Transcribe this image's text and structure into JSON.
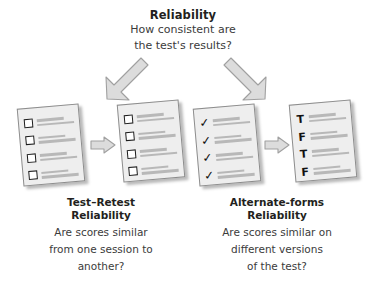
{
  "header": {
    "title": "Reliability",
    "subtitle_line1": "How consistent are",
    "subtitle_line2": "the test's results?"
  },
  "colors": {
    "background": "#ffffff",
    "text": "#231f20",
    "body_text": "#3b3b3b",
    "card_fill": "#eeeeee",
    "card_border": "#8d8d8d",
    "line_fill": "#b8b8b8",
    "arrow_fill": "#dcdcdc",
    "arrow_stroke": "#9a9a9a",
    "mark_color": "#111111"
  },
  "arrows": {
    "fan_left": "arrow-down-left-icon",
    "fan_right": "arrow-down-right-icon",
    "connector": "arrow-right-icon"
  },
  "groups": [
    {
      "id": "test-retest",
      "caption_title_line1": "Test–Retest",
      "caption_title_line2": "Reliability",
      "caption_body_line1": "Are scores similar",
      "caption_body_line2": "from one session to",
      "caption_body_line3": "another?",
      "cards": [
        {
          "id": "test-retest-card-1",
          "mark_type": "box",
          "marks": [
            "",
            "",
            "",
            ""
          ]
        },
        {
          "id": "test-retest-card-2",
          "mark_type": "box",
          "marks": [
            "",
            "",
            "",
            ""
          ]
        }
      ]
    },
    {
      "id": "alternate-forms",
      "caption_title_line1": "Alternate-forms",
      "caption_title_line2": "Reliability",
      "caption_body_line1": "Are scores similar on",
      "caption_body_line2": "different versions",
      "caption_body_line3": "of the test?",
      "cards": [
        {
          "id": "alternate-forms-card-1",
          "mark_type": "check",
          "marks": [
            "✓",
            "✓",
            "✓",
            "✓"
          ]
        },
        {
          "id": "alternate-forms-card-2",
          "mark_type": "letter",
          "marks": [
            "T",
            "F",
            "T",
            "F"
          ]
        }
      ]
    }
  ]
}
